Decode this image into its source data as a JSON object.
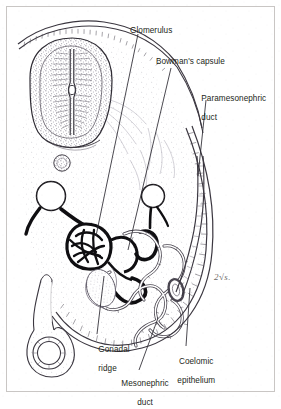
{
  "figure": {
    "kind": "scientific-illustration",
    "background_color": "#ffffff",
    "ink_color": "#231f20",
    "stipple_color": "#6f6a7a",
    "frame": {
      "visible": true,
      "color": "#c9c6c4"
    }
  },
  "labels": [
    {
      "id": "glomerulus",
      "text": "Glomerulus",
      "x": 130,
      "y": 31,
      "lines": [
        "Glomerulus"
      ]
    },
    {
      "id": "bowmans-capsule",
      "text": "Bowman's capsule",
      "x": 158,
      "y": 62,
      "lines": [
        "Bowman's capsule"
      ]
    },
    {
      "id": "paramesonephric-duct",
      "text": "Paramesonephric duct",
      "x": 193,
      "y": 90,
      "lines": [
        "Paramesonephric",
        "duct"
      ]
    },
    {
      "id": "gonadal-ridge",
      "text": "Gonadal ridge",
      "x": 90,
      "y": 340,
      "lines": [
        "Gonadal",
        "ridge"
      ]
    },
    {
      "id": "coelomic-epithelium",
      "text": "Coelomic epithelium",
      "x": 170,
      "y": 352,
      "lines": [
        "Coelomic",
        "epithelium"
      ]
    },
    {
      "id": "mesonephric-duct",
      "text": "Mesonephric duct",
      "x": 116,
      "y": 374,
      "lines": [
        "Mesonephric",
        "duct"
      ]
    }
  ],
  "annotation": {
    "id": "pencil-mark",
    "text": "2√s.",
    "x": 214,
    "y": 279,
    "style": "handwritten-pencil"
  },
  "structures": [
    {
      "id": "neural-tube",
      "name": "neural tube"
    },
    {
      "id": "surface-ectoderm",
      "name": "surface ectoderm"
    },
    {
      "id": "notochord",
      "name": "notochord"
    },
    {
      "id": "dorsal-aorta-left",
      "name": "dorsal aorta (left)"
    },
    {
      "id": "dorsal-aorta-right",
      "name": "dorsal aorta (right)"
    },
    {
      "id": "glomerulus-tuft",
      "name": "glomerular capillary tuft"
    },
    {
      "id": "bowmans-capsule-shape",
      "name": "Bowman's capsule"
    },
    {
      "id": "mesonephric-tubules",
      "name": "mesonephric tubules"
    },
    {
      "id": "mesonephric-duct-shape",
      "name": "mesonephric duct"
    },
    {
      "id": "paramesonephric-duct-shape",
      "name": "paramesonephric duct"
    },
    {
      "id": "coelomic-epithelium-shape",
      "name": "coelomic epithelium"
    },
    {
      "id": "gonadal-ridge-shape",
      "name": "gonadal ridge"
    },
    {
      "id": "gut-tube",
      "name": "gut tube"
    },
    {
      "id": "dorsal-mesentery",
      "name": "dorsal mesentery"
    }
  ]
}
